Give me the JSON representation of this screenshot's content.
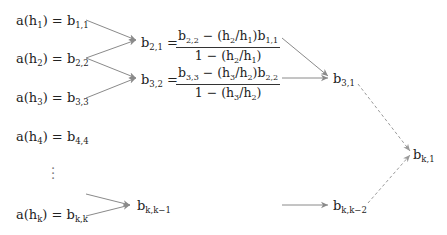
{
  "diagram": {
    "type": "Neville / Richardson extrapolation tableau",
    "column0": [
      {
        "lhs": "a(h",
        "idx": "1",
        "rhs": "b",
        "sub": "1,1"
      },
      {
        "lhs": "a(h",
        "idx": "2",
        "rhs": "b",
        "sub": "2,2"
      },
      {
        "lhs": "a(h",
        "idx": "3",
        "rhs": "b",
        "sub": "3,3"
      },
      {
        "lhs": "a(h",
        "idx": "4",
        "rhs": "b",
        "sub": "4,4"
      },
      {
        "lhs": "a(h",
        "idx": "k",
        "rhs": "b",
        "sub": "k,k"
      }
    ],
    "ellipsis": "⋮",
    "column1": [
      {
        "lhs": "b",
        "lhs_sub": "2,1",
        "num_a": "b",
        "num_a_sub": "2,2",
        "num_mid": " − (h",
        "num_h1": "2",
        "num_slash": "/h",
        "num_h2": "1",
        "num_end": ")b",
        "num_b_sub": "1,1",
        "den_pre": "1 − (h",
        "den_h1": "2",
        "den_slash": "/h",
        "den_h2": "1",
        "den_end": ")"
      },
      {
        "lhs": "b",
        "lhs_sub": "3,2",
        "num_a": "b",
        "num_a_sub": "3,3",
        "num_mid": " − (h",
        "num_h1": "3",
        "num_slash": "/h",
        "num_h2": "2",
        "num_end": ")b",
        "num_b_sub": "2,2",
        "den_pre": "1 − (h",
        "den_h1": "3",
        "den_slash": "/h",
        "den_h2": "2",
        "den_end": ")"
      },
      {
        "lhs": "b",
        "lhs_sub": "k,k−1"
      }
    ],
    "column2": [
      {
        "lhs": "b",
        "lhs_sub": "3,1"
      },
      {
        "lhs": "b",
        "lhs_sub": "k,k−2"
      }
    ],
    "final": {
      "lhs": "b",
      "lhs_sub": "k,1"
    },
    "eq": " = ",
    "close_paren": ")",
    "arrow_color": "#8a8a8a",
    "dashed_arrow_color": "#9a9a9a"
  }
}
